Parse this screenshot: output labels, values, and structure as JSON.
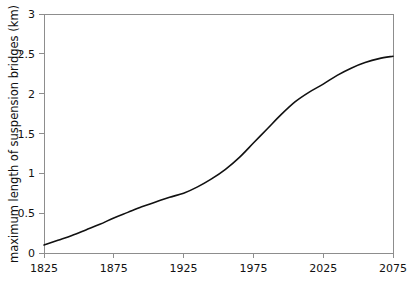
{
  "chart_data": {
    "type": "line",
    "title": "",
    "xlabel": "",
    "ylabel": "maximum length of suspension bridges (km)",
    "xlim": [
      1825,
      2075
    ],
    "ylim": [
      0,
      3
    ],
    "grid": false,
    "legend": null,
    "x_ticks": [
      "1825",
      "1875",
      "1925",
      "1975",
      "2025",
      "2075"
    ],
    "x_tick_values": [
      1825,
      1875,
      1925,
      1975,
      2025,
      2075
    ],
    "y_ticks": [
      "0",
      "0.5",
      "1",
      "1.5",
      "2",
      "2.5",
      "3"
    ],
    "y_tick_values": [
      0,
      0.5,
      1,
      1.5,
      2,
      2.5,
      3
    ],
    "series": [
      {
        "name": "maximum length of suspension bridges",
        "color": "#111111",
        "x": [
          1825,
          1835,
          1845,
          1855,
          1865,
          1875,
          1885,
          1895,
          1905,
          1915,
          1925,
          1935,
          1945,
          1955,
          1965,
          1975,
          1985,
          1995,
          2005,
          2015,
          2025,
          2035,
          2045,
          2055,
          2065,
          2075
        ],
        "values": [
          0.1,
          0.16,
          0.22,
          0.29,
          0.36,
          0.44,
          0.51,
          0.58,
          0.64,
          0.7,
          0.75,
          0.83,
          0.93,
          1.05,
          1.2,
          1.38,
          1.56,
          1.74,
          1.9,
          2.02,
          2.12,
          2.23,
          2.32,
          2.39,
          2.44,
          2.47
        ]
      }
    ]
  },
  "axes": {
    "y_axis_label": "maximum length of suspension bridges (km)"
  },
  "colors": {
    "curve": "#111111",
    "axis": "#8d8d8d",
    "background": "#ffffff",
    "text": "#111111"
  }
}
